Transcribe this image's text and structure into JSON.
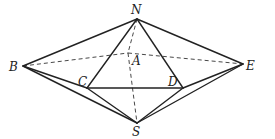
{
  "diagram": {
    "type": "geometry-solid",
    "vertices": {
      "N": {
        "x": 137,
        "y": 19,
        "label": "N",
        "lx": 131,
        "ly": 14
      },
      "B": {
        "x": 23,
        "y": 66,
        "label": "B",
        "lx": 9,
        "ly": 71
      },
      "E": {
        "x": 243,
        "y": 64,
        "label": "E",
        "lx": 246,
        "ly": 70
      },
      "C": {
        "x": 87,
        "y": 88,
        "label": "C",
        "lx": 78,
        "ly": 86
      },
      "D": {
        "x": 183,
        "y": 88,
        "label": "D",
        "lx": 168,
        "ly": 86
      },
      "S": {
        "x": 137,
        "y": 123,
        "label": "S",
        "lx": 132,
        "ly": 136
      },
      "A": {
        "x": 128,
        "y": 53,
        "label": "A",
        "lx": 132,
        "ly": 65
      }
    },
    "solid_edges": [
      [
        "N",
        "B"
      ],
      [
        "N",
        "E"
      ],
      [
        "N",
        "C"
      ],
      [
        "N",
        "D"
      ],
      [
        "C",
        "D"
      ],
      [
        "B",
        "S"
      ],
      [
        "E",
        "S"
      ],
      [
        "C",
        "S"
      ],
      [
        "D",
        "S"
      ],
      [
        "B",
        "C"
      ],
      [
        "D",
        "E"
      ]
    ],
    "dashed_edges": [
      [
        "B",
        "A"
      ],
      [
        "A",
        "E"
      ],
      [
        "N",
        "A"
      ],
      [
        "A",
        "S"
      ]
    ]
  }
}
